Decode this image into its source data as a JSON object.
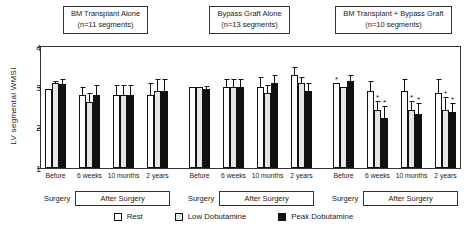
{
  "colors": {
    "outline": "#111111",
    "rest_fill": "#ffffff",
    "low_fill": "#c8c8c8",
    "peak_fill": "#111111"
  },
  "y_axis": {
    "label": "LV segmental WMSI",
    "ticks": [
      4,
      3,
      2,
      1
    ],
    "min": 1,
    "max": 4
  },
  "footer": {
    "surgery_label": "Surgery",
    "after_surgery_label": "After Surgery"
  },
  "legend": {
    "items": [
      {
        "label": "Rest",
        "swatch": "rest"
      },
      {
        "label": "Low Dobutamine",
        "swatch": "low"
      },
      {
        "label": "Peak Dobutamine",
        "swatch": "peak"
      }
    ]
  },
  "chart_data": {
    "type": "bar",
    "ylabel": "LV segmental WMSI",
    "ylim": [
      1,
      4
    ],
    "grid": false,
    "legend_position": "bottom",
    "categories": [
      "Before",
      "6 weeks",
      "10 months",
      "2 years"
    ],
    "series_names": [
      "Rest",
      "Low Dobutamine",
      "Peak Dobutamine"
    ],
    "annotation_note": "* = significant change; T bars = SD error bars",
    "panels": [
      {
        "title": "BM Transplant Alone",
        "subtitle": "(n=11 segments)",
        "series": [
          {
            "name": "Rest",
            "values": [
              2.97,
              2.8,
              2.8,
              2.8
            ],
            "errors": [
              0,
              0.2,
              0.25,
              0.3
            ],
            "sig": [
              false,
              false,
              false,
              false
            ]
          },
          {
            "name": "Low Dobutamine",
            "values": [
              3.1,
              2.65,
              2.8,
              2.9
            ],
            "errors": [
              0.05,
              0.2,
              0.25,
              0.3
            ],
            "sig": [
              false,
              false,
              false,
              false
            ]
          },
          {
            "name": "Peak Dobutamine",
            "values": [
              3.08,
              2.8,
              2.8,
              2.9
            ],
            "errors": [
              0.12,
              0.25,
              0.25,
              0.3
            ],
            "sig": [
              false,
              false,
              false,
              false
            ]
          }
        ]
      },
      {
        "title": "Bypass Graft Alone",
        "subtitle": "(n=13 segments)",
        "series": [
          {
            "name": "Rest",
            "values": [
              3.0,
              3.0,
              3.0,
              3.3
            ],
            "errors": [
              0,
              0.2,
              0.25,
              0.2
            ],
            "sig": [
              false,
              false,
              false,
              false
            ]
          },
          {
            "name": "Low Dobutamine",
            "values": [
              3.0,
              3.0,
              2.85,
              3.1
            ],
            "errors": [
              0,
              0.2,
              0.2,
              0.15
            ],
            "sig": [
              false,
              false,
              false,
              false
            ]
          },
          {
            "name": "Peak Dobutamine",
            "values": [
              2.95,
              3.0,
              3.1,
              2.9
            ],
            "errors": [
              0.08,
              0.2,
              0.2,
              0.2
            ],
            "sig": [
              false,
              false,
              false,
              false
            ]
          }
        ]
      },
      {
        "title": "BM Transplant + Bypass Graft",
        "subtitle": "(n=10 segments)",
        "series": [
          {
            "name": "Rest",
            "values": [
              3.1,
              2.9,
              2.9,
              2.85
            ],
            "errors": [
              0,
              0.25,
              0.3,
              0.35
            ],
            "sig": [
              true,
              false,
              false,
              false
            ]
          },
          {
            "name": "Low Dobutamine",
            "values": [
              3.0,
              2.45,
              2.45,
              2.45
            ],
            "errors": [
              0,
              0.2,
              0.2,
              0.3
            ],
            "sig": [
              false,
              true,
              true,
              true
            ]
          },
          {
            "name": "Peak Dobutamine",
            "values": [
              3.15,
              2.25,
              2.35,
              2.4
            ],
            "errors": [
              0.15,
              0.3,
              0.25,
              0.2
            ],
            "sig": [
              false,
              true,
              true,
              true
            ]
          }
        ]
      }
    ]
  }
}
